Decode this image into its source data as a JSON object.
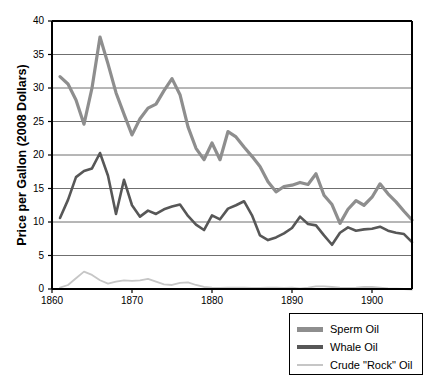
{
  "chart_data": {
    "type": "line",
    "title": "",
    "xlabel": "",
    "ylabel": "Price per Gallon (2008 Dollars)",
    "xlim": [
      1860,
      1905
    ],
    "ylim": [
      0,
      40
    ],
    "xticks": [
      1860,
      1870,
      1880,
      1890,
      1900
    ],
    "yticks": [
      0,
      5,
      10,
      15,
      20,
      25,
      30,
      35,
      40
    ],
    "grid": "horizontal",
    "legend_position": "below-right",
    "x": [
      1861,
      1862,
      1863,
      1864,
      1865,
      1866,
      1867,
      1868,
      1869,
      1870,
      1871,
      1872,
      1873,
      1874,
      1875,
      1876,
      1877,
      1878,
      1879,
      1880,
      1881,
      1882,
      1883,
      1884,
      1885,
      1886,
      1887,
      1888,
      1889,
      1890,
      1891,
      1892,
      1893,
      1894,
      1895,
      1896,
      1897,
      1898,
      1899,
      1900,
      1901,
      1902,
      1903,
      1904,
      1905
    ],
    "series": [
      {
        "name": "Sperm Oil",
        "color": "#8e8e8e",
        "width": 3.2,
        "values": [
          31.7,
          30.6,
          28.2,
          24.6,
          30.0,
          37.6,
          33.6,
          29.3,
          26.1,
          23.0,
          25.4,
          27.0,
          27.6,
          29.6,
          31.4,
          29.0,
          24.2,
          21.0,
          19.3,
          21.8,
          19.3,
          23.5,
          22.7,
          21.2,
          19.8,
          18.3,
          16.0,
          14.5,
          15.3,
          15.5,
          15.9,
          15.6,
          17.2,
          14.0,
          12.6,
          9.8,
          11.9,
          13.2,
          12.5,
          13.7,
          15.7,
          14.2,
          13.0,
          11.6,
          10.3
        ]
      },
      {
        "name": "Whale Oil",
        "color": "#575757",
        "width": 2.6,
        "values": [
          10.6,
          13.3,
          16.7,
          17.6,
          18.0,
          20.3,
          16.9,
          11.2,
          16.3,
          12.5,
          10.8,
          11.7,
          11.2,
          11.9,
          12.3,
          12.6,
          10.9,
          9.6,
          8.8,
          11.0,
          10.4,
          12.0,
          12.5,
          13.1,
          11.0,
          8.0,
          7.3,
          7.7,
          8.3,
          9.1,
          10.8,
          9.7,
          9.5,
          8.0,
          6.6,
          8.4,
          9.2,
          8.7,
          8.9,
          9.0,
          9.3,
          8.7,
          8.4,
          8.2,
          7.0
        ]
      },
      {
        "name": "Crude \"Rock\" Oil",
        "color": "#c6c6c6",
        "width": 1.8,
        "values": [
          0.2,
          0.6,
          1.6,
          2.6,
          2.1,
          1.3,
          0.8,
          1.1,
          1.3,
          1.2,
          1.3,
          1.5,
          1.1,
          0.7,
          0.6,
          0.9,
          1.0,
          0.6,
          0.3,
          0.2,
          0.15,
          0.2,
          0.2,
          0.2,
          0.15,
          0.15,
          0.2,
          0.2,
          0.15,
          0.2,
          0.1,
          0.2,
          0.4,
          0.4,
          0.3,
          0.2,
          0.15,
          0.2,
          0.3,
          0.3,
          0.2,
          0.1,
          0.05,
          0.0,
          -0.1
        ]
      }
    ]
  },
  "axes": {
    "ytick_labels": [
      "40",
      "35",
      "30",
      "25",
      "20",
      "15",
      "10",
      "5",
      "0"
    ],
    "xtick_labels": [
      "1860",
      "1870",
      "1880",
      "1890",
      "1900"
    ],
    "ylabel": "Price per Gallon (2008 Dollars)"
  },
  "legend": {
    "items": [
      {
        "label": "Sperm Oil",
        "color": "#8e8e8e",
        "thickness": "5px"
      },
      {
        "label": "Whale Oil",
        "color": "#575757",
        "thickness": "4px"
      },
      {
        "label": "Crude \"Rock\" Oil",
        "color": "#c6c6c6",
        "thickness": "2px"
      }
    ]
  },
  "colors": {
    "axis": "#000000",
    "grid": "#6f6f6f",
    "background": "#ffffff"
  }
}
